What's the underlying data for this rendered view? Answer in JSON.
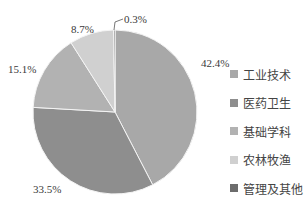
{
  "chart_data": {
    "type": "pie",
    "title": "",
    "start_angle": "12 o'clock, clockwise",
    "categories": [
      "工业技术",
      "医药卫生",
      "基础学科",
      "农林牧渔",
      "管理及其他"
    ],
    "values": [
      42.4,
      33.5,
      15.1,
      8.7,
      0.3
    ],
    "labels": [
      "42.4%",
      "33.5%",
      "15.1%",
      "8.7%",
      "0.3%"
    ],
    "colors": [
      "#a8a8a8",
      "#8e8e8e",
      "#b2b2b2",
      "#d0d0d0",
      "#6c6c6c"
    ],
    "legend_position": "right"
  },
  "legend": [
    {
      "label": "工业技术"
    },
    {
      "label": "医药卫生"
    },
    {
      "label": "基础学科"
    },
    {
      "label": "农林牧渔"
    },
    {
      "label": "管理及其他"
    }
  ],
  "slice_labels": {
    "s0": "42.4%",
    "s1": "33.5%",
    "s2": "15.1%",
    "s3": "8.7%",
    "s4": "0.3%"
  }
}
